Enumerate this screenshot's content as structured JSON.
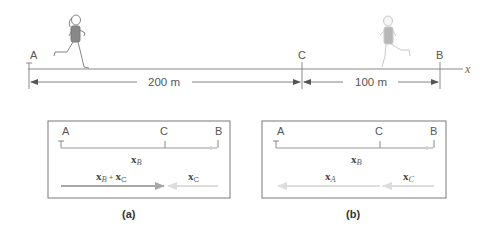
{
  "figure": {
    "track": {
      "points": [
        {
          "label": "A",
          "x_px": 29
        },
        {
          "label": "C",
          "x_px": 302
        },
        {
          "label": "B",
          "x_px": 440
        }
      ],
      "axis_label": "x",
      "distances": [
        {
          "from": "A",
          "to": "C",
          "label": "200 m"
        },
        {
          "from": "C",
          "to": "B",
          "label": "100 m"
        }
      ],
      "runners": [
        {
          "name": "runner-at-start",
          "position": "near A",
          "faded": false
        },
        {
          "name": "runner-near-B",
          "position": "between C and B",
          "faded": true
        }
      ]
    },
    "panel_a": {
      "caption": "(a)",
      "points": [
        "A",
        "C",
        "B"
      ],
      "top_vector": {
        "symbol": "x",
        "subscript": "B"
      },
      "vectors": [
        {
          "symbol": "x",
          "subscript": "B",
          "plus": "+",
          "symbol2": "x",
          "subscript2": "C",
          "direction": "right",
          "color": "#a8a8a8"
        },
        {
          "symbol": "x",
          "subscript": "C",
          "direction": "left",
          "color": "#dcdcdc"
        }
      ]
    },
    "panel_b": {
      "caption": "(b)",
      "points": [
        "A",
        "C",
        "B"
      ],
      "top_vector": {
        "symbol": "x",
        "subscript": "B"
      },
      "vectors": [
        {
          "symbol": "x",
          "subscript": "A",
          "direction": "left",
          "color": "#dcdcdc"
        },
        {
          "symbol": "x",
          "subscript": "C",
          "direction": "left",
          "color": "#dcdcdc"
        }
      ]
    },
    "colors": {
      "line": "#8a8a8a",
      "box_border": "#777777",
      "arrow_dark": "#a8a8a8",
      "arrow_light": "#dcdcdc",
      "text": "#555555"
    }
  }
}
